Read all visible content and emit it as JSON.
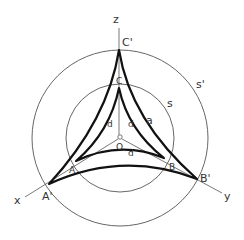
{
  "figure": {
    "type": "geometric-diagram"
  },
  "labels": {
    "axis_z": "z",
    "axis_x": "x",
    "axis_y": "y",
    "vertex_c_prime": "C'",
    "vertex_c": "C",
    "vertex_a": "A",
    "vertex_a_prime": "A'",
    "vertex_b": "B",
    "vertex_b_prime": "B'",
    "center": "O",
    "circle_inner": "s",
    "circle_outer": "s'",
    "side_label": "a",
    "distance_1": "d",
    "distance_2": "d",
    "distance_3": "d"
  },
  "colors": {
    "thick_line": "#111111",
    "thin_line": "#555555",
    "text": "#333333"
  }
}
